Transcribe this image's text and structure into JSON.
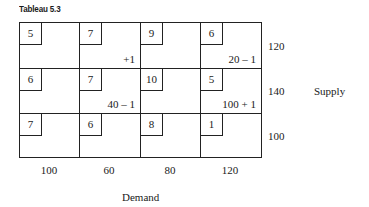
{
  "title": "Tableau 5.3",
  "grid": {
    "rows": [
      [
        {
          "cost": "5",
          "alloc": ""
        },
        {
          "cost": "7",
          "alloc": "+1"
        },
        {
          "cost": "9",
          "alloc": ""
        },
        {
          "cost": "6",
          "alloc": "20 – 1"
        }
      ],
      [
        {
          "cost": "6",
          "alloc": ""
        },
        {
          "cost": "7",
          "alloc": "40 – 1"
        },
        {
          "cost": "10",
          "alloc": ""
        },
        {
          "cost": "5",
          "alloc": "100 + 1"
        }
      ],
      [
        {
          "cost": "7",
          "alloc": ""
        },
        {
          "cost": "6",
          "alloc": ""
        },
        {
          "cost": "8",
          "alloc": ""
        },
        {
          "cost": "1",
          "alloc": ""
        }
      ]
    ]
  },
  "supply": {
    "label": "Supply",
    "values": [
      "120",
      "140",
      "100"
    ]
  },
  "demand": {
    "label": "Demand",
    "values": [
      "100",
      "60",
      "80",
      "120"
    ]
  }
}
